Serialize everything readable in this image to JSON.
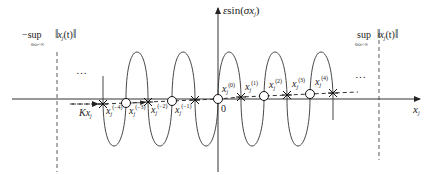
{
  "diagram": {
    "y_axis_label": {
      "prefix": "ε",
      "func": "sin(",
      "arg": "σx",
      "arg_sub": "j",
      "close": ")"
    },
    "x_axis_label": {
      "var": "x",
      "sub": "j"
    },
    "origin_label": "0",
    "left_bound": {
      "sign": "−",
      "op": "sup",
      "range": "0≤t<∞",
      "norm_open": "‖",
      "var": "x",
      "sub": "j",
      "arg": "(t)",
      "norm_close": "‖"
    },
    "right_bound": {
      "sign": "",
      "op": "sup",
      "range": "0≤t<∞",
      "norm_open": "‖",
      "var": "x",
      "sub": "j",
      "arg": "(t)",
      "norm_close": "‖"
    },
    "ellipsis_left": "…",
    "ellipsis_right": "…",
    "kx_label": {
      "coef": "Kx",
      "sub": "j"
    },
    "points": [
      {
        "var": "x",
        "sub": "j",
        "sup": "(−4)",
        "marker": "star"
      },
      {
        "var": "x",
        "sub": "j",
        "sup": "(−3)",
        "marker": "circle"
      },
      {
        "var": "x",
        "sub": "j",
        "sup": "(−2)",
        "marker": "star"
      },
      {
        "var": "x",
        "sub": "j",
        "sup": "(−1)",
        "marker": "star"
      },
      {
        "var": "x",
        "sub": "j",
        "sup": "(0)",
        "marker": "circle"
      },
      {
        "var": "x",
        "sub": "j",
        "sup": "(1)",
        "marker": "star"
      },
      {
        "var": "x",
        "sub": "j",
        "sup": "(2)",
        "marker": "circle"
      },
      {
        "var": "x",
        "sub": "j",
        "sup": "(3)",
        "marker": "star"
      },
      {
        "var": "x",
        "sub": "j",
        "sup": "(4)",
        "marker": "circle"
      }
    ],
    "colors": {
      "line": "#333333",
      "dash": "#666666",
      "bg": "#ffffff"
    }
  }
}
